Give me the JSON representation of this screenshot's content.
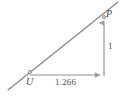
{
  "figure": {
    "type": "geometry-diagram",
    "width": 124,
    "height": 98,
    "background_color": "#ffffff",
    "line_color": "#7f7f7f",
    "arrow_color": "#9a9a9a",
    "text_color": "#4a4a4a"
  },
  "points": {
    "P": {
      "label": "P",
      "x": 104,
      "y": 17
    },
    "U": {
      "label": "U",
      "x": 30,
      "y": 72
    }
  },
  "measures": {
    "vertical": {
      "label": "1",
      "value": 1,
      "from": [
        104,
        75
      ],
      "to": [
        104,
        19
      ]
    },
    "horizontal": {
      "label": "1.266",
      "value": 1.266,
      "from": [
        30,
        75
      ],
      "to": [
        104,
        75
      ]
    }
  },
  "ray": {
    "name": "terminal-ray-through-U-and-P",
    "from": [
      8,
      90
    ],
    "to": [
      118,
      2
    ]
  }
}
